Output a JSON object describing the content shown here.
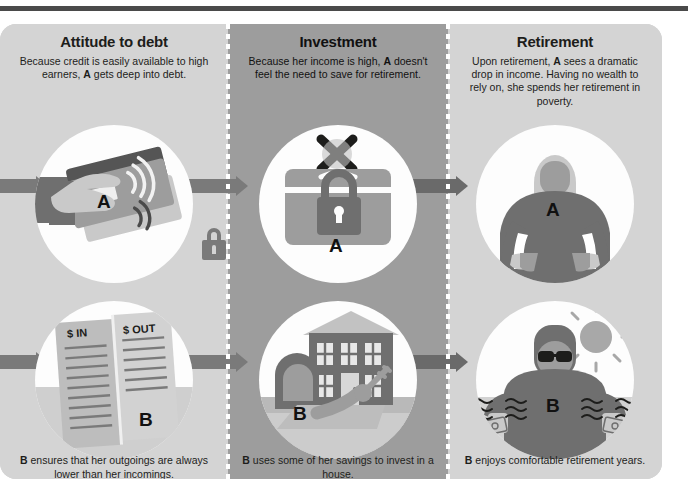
{
  "theme": {
    "panel_bg": "#d4d4d4",
    "panel_bg_highlight": "#9d9d9d",
    "circle_bg": "#fdfdfd",
    "arrow_color": "#7a7a7a",
    "ink": "#1d1d1b",
    "rule_color": "#4a4a4a",
    "figure_dark": "#6f6f6f",
    "figure_light": "#bdbdbd"
  },
  "columns": [
    {
      "id": "attitude-to-debt",
      "title": "Attitude to debt",
      "description_parts": [
        "Because credit is easily available to high earners, ",
        "A",
        " gets deep into debt."
      ],
      "description": "Because credit is easily available to high earners, A gets deep into debt.",
      "top_illustration": {
        "name": "hand-holding-contactless-credit-cards",
        "label": "A",
        "extra_icon": "padlock-icon"
      },
      "bottom_illustration": {
        "name": "ledger-in-out",
        "label": "B",
        "ledger_headers": [
          "$ IN",
          "$ OUT"
        ]
      },
      "caption_parts": [
        "B",
        " ensures that her outgoings are always lower than her incomings."
      ],
      "caption": "B ensures that her outgoings are always lower than her incomings.",
      "highlight": false
    },
    {
      "id": "investment",
      "title": "Investment",
      "description_parts": [
        "Because her income is high, ",
        "A",
        " doesn't feel the need to save for retirement."
      ],
      "description": "Because her income is high, A doesn't feel the need to save for retirement.",
      "top_illustration": {
        "name": "locked-chest-crossed-out",
        "label": "A",
        "extra_icon": "cross-x-icon"
      },
      "bottom_illustration": {
        "name": "person-buying-house",
        "label": "B",
        "extra_icon": "key-icon"
      },
      "caption_parts": [
        "B",
        " uses some of her savings to invest in a house."
      ],
      "caption": "B uses some of her savings to invest in a house.",
      "highlight": true
    },
    {
      "id": "retirement",
      "title": "Retirement",
      "description_parts": [
        "Upon retirement, ",
        "A",
        " sees a dramatic drop in income. Having no wealth to rely on, she spends her retirement in poverty."
      ],
      "description": "Upon retirement, A sees a dramatic drop in income. Having no wealth to rely on, she spends her retirement in poverty.",
      "top_illustration": {
        "name": "person-with-empty-pockets",
        "label": "A"
      },
      "bottom_illustration": {
        "name": "person-relaxing-with-money-and-sun",
        "label": "B",
        "extra_icon": "sun-icon"
      },
      "caption_parts": [
        "B",
        " enjoys comfortable retirement years."
      ],
      "caption": "B enjoys comfortable retirement years.",
      "highlight": false
    }
  ],
  "flow": {
    "arrow_icon": "right-arrow-icon",
    "rows": [
      "person-a-timeline",
      "person-b-timeline"
    ]
  }
}
